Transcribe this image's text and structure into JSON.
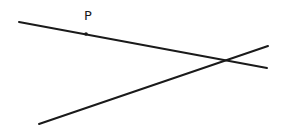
{
  "diagram": {
    "point": {
      "label": "P",
      "x": 86,
      "y": 34
    },
    "lines": [
      {
        "name": "line-1",
        "x1": 19,
        "y1": 22,
        "x2": 267,
        "y2": 68
      },
      {
        "name": "line-2",
        "x1": 39,
        "y1": 124,
        "x2": 268,
        "y2": 46
      }
    ],
    "stroke_color": "#1a1a1a"
  }
}
